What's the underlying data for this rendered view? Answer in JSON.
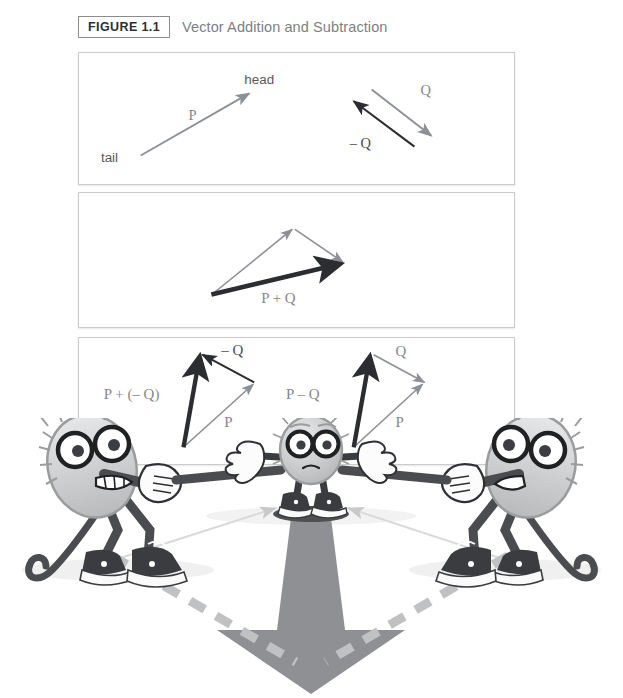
{
  "header": {
    "figure_number": "FIGURE 1.1",
    "title": "Vector Addition and Subtraction"
  },
  "panels": [
    {
      "id": "panel-1",
      "name": "vector-definition-panel",
      "labels": {
        "head": "head",
        "tail": "tail",
        "p": "P",
        "q": "Q",
        "neg_q": "– Q"
      }
    },
    {
      "id": "panel-2",
      "name": "vector-addition-panel",
      "labels": {
        "sum": "P + Q"
      }
    },
    {
      "id": "panel-3",
      "name": "vector-subtraction-panel",
      "labels": {
        "p_plus_neg_q": "P + (– Q)",
        "neg_q": "– Q",
        "p_left": "P",
        "p_minus_q": "P – Q",
        "q_right": "Q",
        "p_right": "P"
      }
    }
  ],
  "illustration": {
    "name": "tug-of-war-cartoon",
    "description": "Two fuzzy cartoon characters with round glasses and sneakers pull ropes attached to a smaller center character; a large gray resultant arrow points downward with dashed gray construction lines forming a parallelogram.",
    "characters": [
      {
        "position": "left",
        "name": "left-puller-character"
      },
      {
        "position": "center",
        "name": "center-character"
      },
      {
        "position": "right",
        "name": "right-puller-character"
      }
    ],
    "resultant_arrow": {
      "direction": "down",
      "name": "resultant-force-arrow"
    }
  },
  "colors": {
    "panel_border": "#c9cbcd",
    "title_text": "#7c7f83",
    "figure_box_border": "#8a8d90",
    "vector_gray": "#8d9094",
    "vector_black": "#2b2d30",
    "label_gray": "#85888c",
    "cartoon_body": "#c9cacb",
    "cartoon_dark": "#3a3c3f",
    "arrow_gray": "#8e9094",
    "dash_gray": "#bfc1c3"
  }
}
